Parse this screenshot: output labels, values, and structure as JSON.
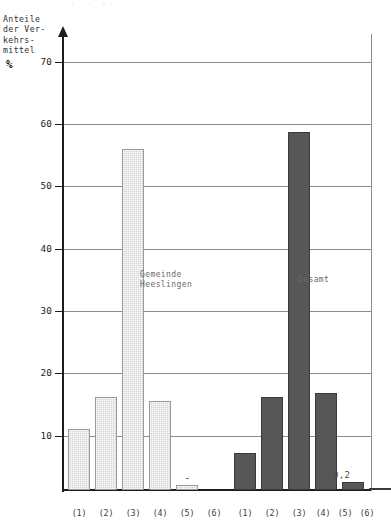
{
  "figure": {
    "cut_header_remnant": "·  ·      ·· ",
    "y_axis_caption": "Anteile\nder Ver-\nkehrs-\nmittel",
    "percent_symbol": "%"
  },
  "chart_data": {
    "type": "bar",
    "title": "",
    "subtitle": "",
    "xlabel": "",
    "ylabel": "Anteile der Verkehrsmittel",
    "yunit": "%",
    "ylim": [
      0,
      73
    ],
    "yticks": [
      10,
      20,
      30,
      40,
      50,
      60,
      70
    ],
    "ytick_labels": [
      "10",
      "20",
      "30",
      "40",
      "50",
      "60",
      "70"
    ],
    "grid": true,
    "grid_axis": "y",
    "legend_position": "in-plot-annotations",
    "categories": [
      "(1)",
      "(2)",
      "(3)",
      "(4)",
      "(5)",
      "(6)"
    ],
    "groups": [
      {
        "name": "Gemeinde Heeslingen",
        "label_lines": "Gemeinde\nHeeslingen",
        "style": "light-hatched",
        "color": "#d6d6d6",
        "values": [
          10.4,
          15.8,
          58.2,
          15.2,
          0.9,
          0
        ],
        "value_annotations": [
          "",
          "",
          "",
          "",
          "",
          "-"
        ]
      },
      {
        "name": "Gesamt",
        "label_lines": "Gesamt",
        "style": "solid-dark",
        "color": "#575757",
        "values": [
          6.4,
          15.9,
          61.0,
          16.5,
          1.4,
          0.2
        ],
        "value_annotations": [
          "",
          "",
          "",
          "",
          "",
          "0,2"
        ]
      }
    ]
  },
  "axis": {
    "y_tick_10": "10",
    "y_tick_20": "20",
    "y_tick_30": "30",
    "y_tick_40": "40",
    "y_tick_50": "50",
    "y_tick_60": "60",
    "y_tick_70": "70"
  },
  "x_labels_left": [
    "(1)",
    "(2)",
    "(3)",
    "(4)",
    "(5)",
    "(6)"
  ],
  "x_labels_right": [
    "(1)",
    "(2)",
    "(3)",
    "(4)",
    "(5)",
    "(6)"
  ],
  "annotations": {
    "left_group_caption": "Gemeinde\nHeeslingen",
    "right_group_caption": "Gesamt",
    "left_zero_dash": "-",
    "right_small_value": "0,2"
  }
}
